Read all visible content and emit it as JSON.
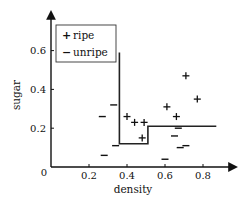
{
  "chart_data": {
    "type": "scatter",
    "title": "",
    "xlabel": "density",
    "ylabel": "sugar",
    "xlim": [
      0,
      0.95
    ],
    "ylim": [
      0,
      0.75
    ],
    "x_ticks": [
      "0.2",
      "0.4",
      "0.6",
      "0.8"
    ],
    "x_tick_values": [
      0.2,
      0.4,
      0.6,
      0.8
    ],
    "y_ticks": [
      "0.2",
      "0.4",
      "0.6"
    ],
    "y_tick_values": [
      0.2,
      0.4,
      0.6
    ],
    "origin_label": "0",
    "grid": false,
    "legend_position": "upper left",
    "series": [
      {
        "name": "ripe",
        "marker": "+",
        "points": [
          [
            0.4,
            0.26
          ],
          [
            0.44,
            0.23
          ],
          [
            0.49,
            0.23
          ],
          [
            0.48,
            0.15
          ],
          [
            0.61,
            0.31
          ],
          [
            0.66,
            0.26
          ],
          [
            0.71,
            0.47
          ],
          [
            0.77,
            0.35
          ]
        ]
      },
      {
        "name": "unripe",
        "marker": "−",
        "points": [
          [
            0.27,
            0.26
          ],
          [
            0.28,
            0.06
          ],
          [
            0.33,
            0.32
          ],
          [
            0.34,
            0.11
          ],
          [
            0.6,
            0.04
          ],
          [
            0.65,
            0.16
          ],
          [
            0.67,
            0.2
          ],
          [
            0.68,
            0.1
          ],
          [
            0.71,
            0.11
          ]
        ]
      }
    ],
    "decision_boundary": [
      [
        0.36,
        0.59
      ],
      [
        0.36,
        0.12
      ],
      [
        0.51,
        0.12
      ],
      [
        0.51,
        0.21
      ],
      [
        0.87,
        0.21
      ]
    ]
  },
  "legend": {
    "items": [
      {
        "symbol": "+",
        "label": "ripe"
      },
      {
        "symbol": "−",
        "label": "unripe"
      }
    ]
  }
}
